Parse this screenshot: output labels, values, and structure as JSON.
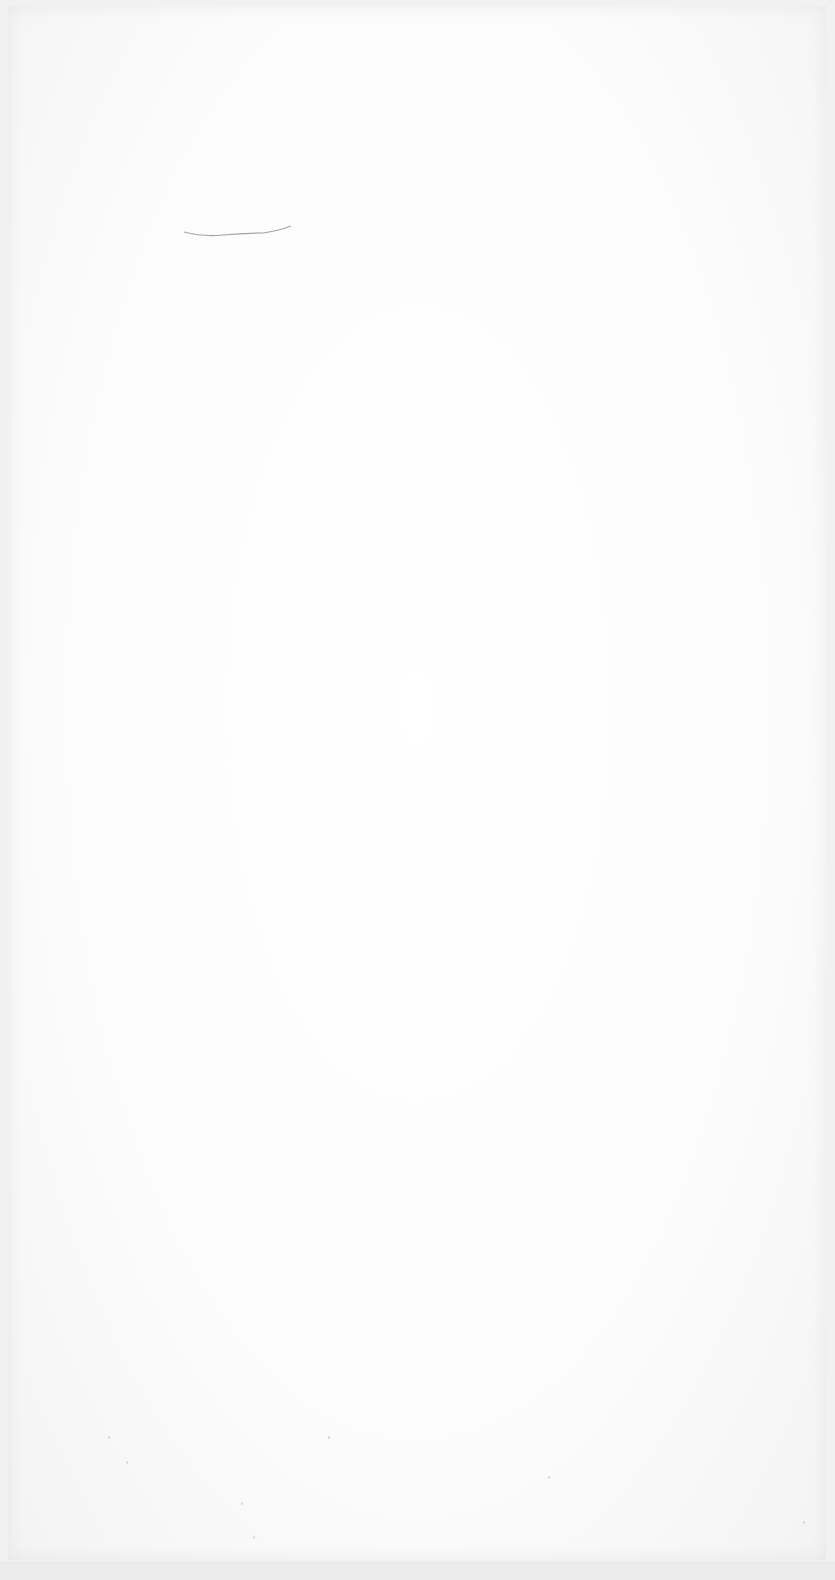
{
  "document": {
    "type": "blank scanned page",
    "text": "",
    "marks": [
      {
        "name": "pencil-stroke",
        "color": "#9a9a9a"
      }
    ]
  }
}
